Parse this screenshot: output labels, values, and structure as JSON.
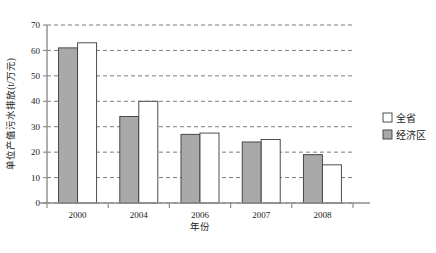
{
  "chart_data": {
    "type": "bar",
    "title": "",
    "xlabel": "年份",
    "ylabel": "单位产值污水排放(t/万元)",
    "categories": [
      "2000",
      "2004",
      "2006",
      "2007",
      "2008"
    ],
    "series": [
      {
        "name": "经济区",
        "values": [
          61,
          34,
          27,
          24,
          19
        ],
        "color": "#a9a9a9"
      },
      {
        "name": "全省",
        "values": [
          63,
          40,
          27.5,
          25,
          15
        ],
        "color": "#ffffff"
      }
    ],
    "ylim": [
      0,
      70
    ],
    "yticks": [
      0,
      10,
      20,
      30,
      40,
      50,
      60,
      70
    ],
    "ytick_labels": [
      "0",
      "10",
      "20",
      "30",
      "40",
      "50",
      "60",
      "70"
    ],
    "grid": true,
    "grid_style": "dashed-horizontal",
    "legend_position": "right-middle",
    "legend": [
      {
        "label": "全省",
        "swatch": "#ffffff"
      },
      {
        "label": "经济区",
        "swatch": "#a9a9a9"
      }
    ]
  },
  "colors": {
    "bar_gray": "#a9a9a9",
    "bar_white": "#ffffff",
    "bar_border": "#3a3a3a",
    "axis": "#8d8d8d",
    "grid": "#6e6e6e",
    "text": "#1a1a1a",
    "background": "#ffffff"
  },
  "geometry": {
    "plot_left": 47,
    "plot_right": 353,
    "plot_top": 25,
    "plot_bottom": 203
  }
}
